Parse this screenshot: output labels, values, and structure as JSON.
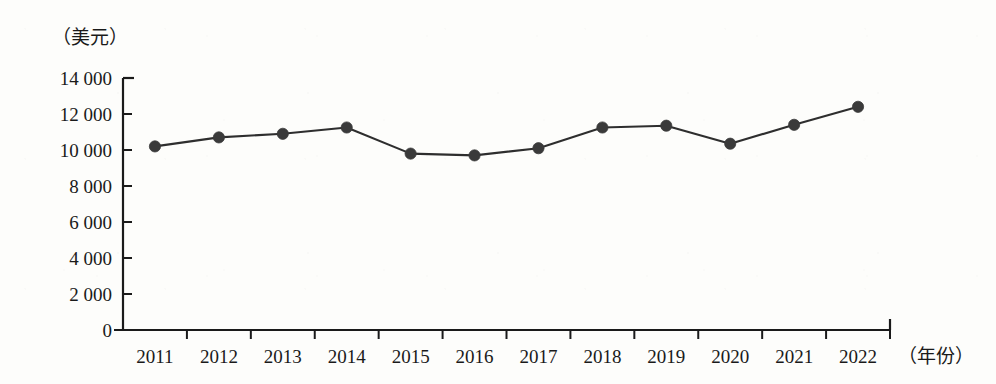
{
  "chart_data": {
    "type": "line",
    "title": "",
    "subtitle": "",
    "xlabel": "（年份）",
    "ylabel": "（美元）",
    "categories": [
      "2011",
      "2012",
      "2013",
      "2014",
      "2015",
      "2016",
      "2017",
      "2018",
      "2019",
      "2020",
      "2021",
      "2022"
    ],
    "values": [
      10200,
      10700,
      10900,
      11250,
      9800,
      9700,
      10100,
      11250,
      11350,
      10350,
      11400,
      12400
    ],
    "series": [
      {
        "name": "人均值（美元）",
        "values": [
          10200,
          10700,
          10900,
          11250,
          9800,
          9700,
          10100,
          11250,
          11350,
          10350,
          11400,
          12400
        ]
      }
    ],
    "ylim": [
      0,
      14000
    ],
    "ytick_values": [
      0,
      2000,
      4000,
      6000,
      8000,
      10000,
      12000,
      14000
    ],
    "ytick_labels": [
      "0",
      "2 000",
      "4 000",
      "6 000",
      "8 000",
      "10 000",
      "12 000",
      "14 000"
    ],
    "xtick_labels": [
      "2011",
      "2012",
      "2013",
      "2014",
      "2015",
      "2016",
      "2017",
      "2018",
      "2019",
      "2020",
      "2021",
      "2022"
    ],
    "grid": false,
    "legend": false,
    "legend_position": "none",
    "annotations": [],
    "marker": "filled-circle",
    "line_color": "#2e2e2e",
    "marker_color": "#3a3a3a",
    "axis_color": "#1a1a1a",
    "background_color": "#fdfdfb"
  },
  "axes": {
    "y_unit_caption": "（美元）",
    "x_unit_caption": "（年份）"
  }
}
